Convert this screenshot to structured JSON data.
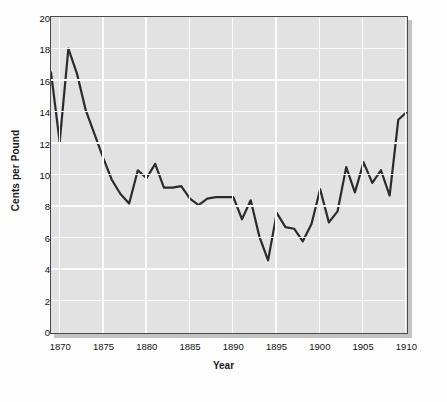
{
  "chart_data": {
    "type": "line",
    "title": "",
    "subtitle": "",
    "xlabel": "Year",
    "ylabel": "Cents per Pound",
    "xlim": [
      1869,
      1910
    ],
    "ylim": [
      0,
      20
    ],
    "xticks": [
      1870,
      1875,
      1880,
      1885,
      1890,
      1895,
      1900,
      1905,
      1910
    ],
    "xtick_labels": [
      "1870",
      "1875",
      "1880",
      "1885",
      "1890",
      "1895",
      "1900",
      "1905",
      "1910"
    ],
    "yticks": [
      0,
      2,
      4,
      6,
      8,
      10,
      12,
      14,
      16,
      18,
      20
    ],
    "ytick_labels": [
      "0",
      "2",
      "4",
      "6",
      "8",
      "10",
      "12",
      "14",
      "16",
      "18",
      "20"
    ],
    "grid": true,
    "grid_color": "#fbfbfb",
    "legend": null,
    "legend_position": "none",
    "annotations": [],
    "series": [
      {
        "name": "Price",
        "line_color": "#2b2b2b",
        "line_width": 2.2,
        "markers": false,
        "x": [
          1869,
          1870,
          1871,
          1872,
          1873,
          1874,
          1875,
          1876,
          1877,
          1878,
          1879,
          1880,
          1881,
          1882,
          1883,
          1884,
          1885,
          1886,
          1887,
          1888,
          1889,
          1890,
          1891,
          1892,
          1893,
          1894,
          1895,
          1896,
          1897,
          1898,
          1899,
          1900,
          1901,
          1902,
          1903,
          1904,
          1905,
          1906,
          1907,
          1908,
          1909,
          1910
        ],
        "y": [
          16.5,
          12.1,
          18.0,
          16.4,
          14.1,
          12.6,
          11.1,
          9.7,
          8.8,
          8.2,
          10.3,
          9.8,
          10.7,
          9.2,
          9.2,
          9.3,
          8.5,
          8.1,
          8.5,
          8.6,
          8.6,
          8.6,
          7.2,
          8.4,
          6.1,
          4.6,
          7.6,
          6.7,
          6.6,
          5.8,
          6.9,
          9.1,
          7.0,
          7.7,
          10.5,
          8.9,
          10.8,
          9.5,
          10.3,
          8.7,
          13.5,
          14.0
        ]
      }
    ]
  },
  "figure": {
    "background_color": "#fdfdfd",
    "plot_background_color": "#e2e2e2",
    "axis_color": "#4a4a4a",
    "text_color": "#121212"
  }
}
